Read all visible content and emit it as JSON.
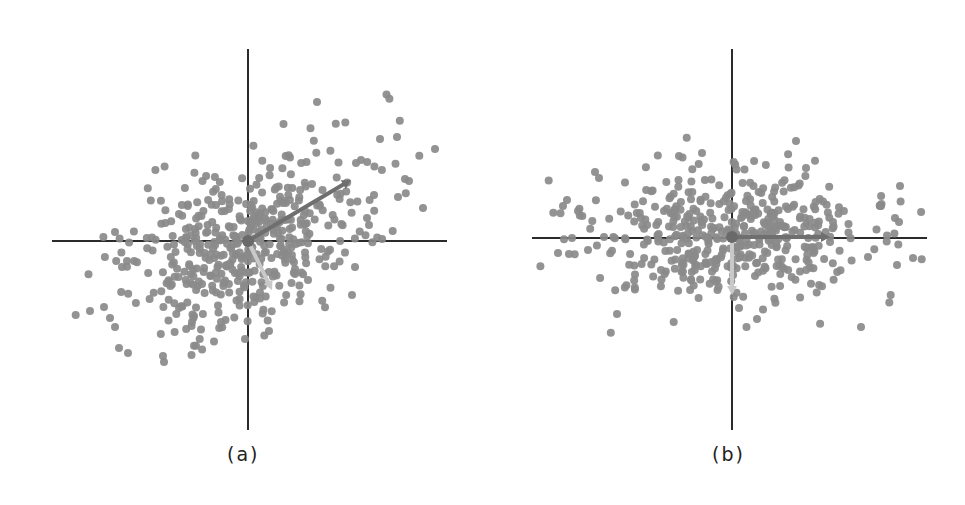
{
  "chart_data": [
    {
      "type": "scatter",
      "title": "",
      "caption": "(a)",
      "description": "Correlated 2D point cloud with principal component arrows (original axes)",
      "xlabel": "",
      "ylabel": "",
      "grid": false,
      "legend": null,
      "origin_px": [
        248,
        241
      ],
      "axes_px": {
        "h": [
          52,
          447,
          241
        ],
        "v": [
          248,
          49,
          430
        ]
      },
      "point_color": "#8a8a8a",
      "point_radius": 4,
      "n_points_approx": 500,
      "cloud": {
        "cx": 0,
        "cy": 0,
        "sx": 62,
        "sy": 38,
        "angle_deg": -30,
        "n": 470,
        "seed": 7
      },
      "outliers": [
        [
          317,
          102
        ],
        [
          380,
          139
        ],
        [
          397,
          137
        ],
        [
          435,
          149
        ],
        [
          361,
          160
        ],
        [
          405,
          179
        ],
        [
          409,
          181
        ],
        [
          398,
          197
        ],
        [
          423,
          208
        ],
        [
          374,
          195
        ],
        [
          356,
          163
        ],
        [
          367,
          218
        ],
        [
          369,
          225
        ],
        [
          352,
          295
        ],
        [
          355,
          267
        ],
        [
          115,
          232
        ],
        [
          127,
          261
        ],
        [
          122,
          267
        ],
        [
          90,
          311
        ],
        [
          104,
          307
        ],
        [
          110,
          318
        ],
        [
          115,
          327
        ],
        [
          119,
          348
        ],
        [
          128,
          353
        ],
        [
          163,
          356
        ],
        [
          164,
          362
        ],
        [
          245,
          339
        ],
        [
          269,
          331
        ],
        [
          221,
          322
        ],
        [
          194,
          316
        ],
        [
          192,
          322
        ]
      ],
      "vectors": [
        {
          "name": "PC1",
          "from": [
            248,
            241
          ],
          "to": [
            351,
            180
          ],
          "color": "#6f6f6f",
          "width": 4
        },
        {
          "name": "PC2",
          "from": [
            248,
            241
          ],
          "to": [
            272,
            290
          ],
          "color": "#c9c9c9",
          "width": 4
        }
      ]
    },
    {
      "type": "scatter",
      "title": "",
      "caption": "(b)",
      "description": "Same point cloud rotated onto principal axes (decorrelated)",
      "xlabel": "",
      "ylabel": "",
      "grid": false,
      "legend": null,
      "origin_px": [
        732,
        237
      ],
      "axes_px": {
        "h": [
          532,
          927,
          238
        ],
        "v": [
          732,
          49,
          430
        ]
      },
      "point_color": "#8a8a8a",
      "point_radius": 4,
      "n_points_approx": 500,
      "cloud": {
        "cx": 0,
        "cy": 0,
        "sx": 68,
        "sy": 33,
        "angle_deg": 0,
        "n": 470,
        "seed": 11
      },
      "outliers": [
        [
          796,
          141
        ],
        [
          595,
          172
        ],
        [
          599,
          178
        ],
        [
          563,
          206
        ],
        [
          567,
          200
        ],
        [
          900,
          186
        ],
        [
          895,
          218
        ],
        [
          899,
          222
        ],
        [
          881,
          206
        ],
        [
          868,
          257
        ],
        [
          913,
          258
        ],
        [
          897,
          265
        ],
        [
          861,
          327
        ],
        [
          617,
          314
        ],
        [
          757,
          319
        ],
        [
          739,
          308
        ],
        [
          569,
          254
        ],
        [
          558,
          253
        ],
        [
          572,
          238
        ],
        [
          604,
          237
        ],
        [
          588,
          250
        ],
        [
          679,
          156
        ],
        [
          702,
          153
        ],
        [
          806,
          168
        ]
      ],
      "vectors": [
        {
          "name": "PC1",
          "from": [
            732,
            237
          ],
          "to": [
            830,
            237
          ],
          "color": "#6f6f6f",
          "width": 4
        },
        {
          "name": "PC2",
          "from": [
            732,
            237
          ],
          "to": [
            732,
            295
          ],
          "color": "#c9c9c9",
          "width": 4
        }
      ]
    }
  ],
  "captions": {
    "a": "(a)",
    "b": "(b)"
  }
}
